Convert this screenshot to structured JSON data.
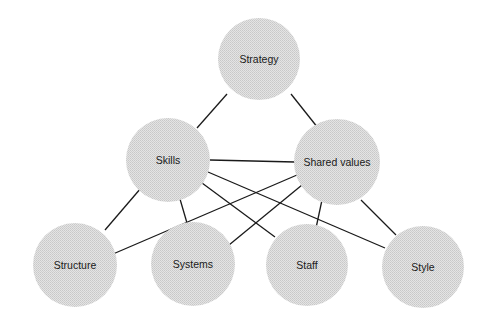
{
  "diagram": {
    "title": "",
    "node_fill": "#dcdcdc",
    "edge_color": "#1a1a1a",
    "nodes": [
      {
        "id": "strategy",
        "label": "Strategy",
        "cx": 259,
        "cy": 59,
        "r": 41
      },
      {
        "id": "skills",
        "label": "Skills",
        "cx": 168,
        "cy": 160,
        "r": 42
      },
      {
        "id": "shared_values",
        "label": "Shared values",
        "cx": 337,
        "cy": 162,
        "r": 43
      },
      {
        "id": "structure",
        "label": "Structure",
        "cx": 75,
        "cy": 265,
        "r": 42
      },
      {
        "id": "systems",
        "label": "Systems",
        "cx": 193,
        "cy": 264,
        "r": 42
      },
      {
        "id": "staff",
        "label": "Staff",
        "cx": 307,
        "cy": 265,
        "r": 41
      },
      {
        "id": "style",
        "label": "Style",
        "cx": 423,
        "cy": 267,
        "r": 41
      }
    ],
    "edges": [
      {
        "from": "strategy",
        "to": "skills",
        "x1": 227,
        "y1": 94,
        "x2": 197,
        "y2": 128
      },
      {
        "from": "strategy",
        "to": "shared_values",
        "x1": 291,
        "y1": 94,
        "x2": 318,
        "y2": 128
      },
      {
        "from": "skills",
        "to": "shared_values",
        "x1": 210,
        "y1": 160,
        "x2": 295,
        "y2": 162
      },
      {
        "from": "skills",
        "to": "structure",
        "x1": 141,
        "y1": 188,
        "x2": 105,
        "y2": 230
      },
      {
        "from": "skills",
        "to": "systems",
        "x1": 180,
        "y1": 199,
        "x2": 187,
        "y2": 223
      },
      {
        "from": "skills",
        "to": "staff",
        "x1": 202,
        "y1": 183,
        "x2": 275,
        "y2": 237
      },
      {
        "from": "skills",
        "to": "style",
        "x1": 208,
        "y1": 172,
        "x2": 385,
        "y2": 248
      },
      {
        "from": "shared_values",
        "to": "structure",
        "x1": 297,
        "y1": 175,
        "x2": 113,
        "y2": 254
      },
      {
        "from": "shared_values",
        "to": "systems",
        "x1": 302,
        "y1": 185,
        "x2": 229,
        "y2": 245
      },
      {
        "from": "shared_values",
        "to": "staff",
        "x1": 322,
        "y1": 200,
        "x2": 316,
        "y2": 228
      },
      {
        "from": "shared_values",
        "to": "style",
        "x1": 361,
        "y1": 200,
        "x2": 396,
        "y2": 235
      }
    ]
  }
}
